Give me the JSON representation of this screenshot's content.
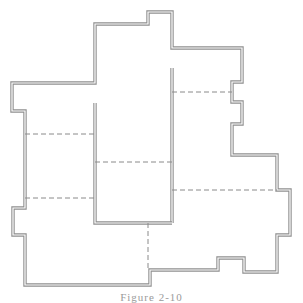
{
  "figure": {
    "caption": "Figure 2-10",
    "wall_color": "#8f8f8f",
    "dash_color": "#8a8a8a",
    "outer_wall": [
      [
        95,
        24
      ],
      [
        148,
        24
      ],
      [
        148,
        12
      ],
      [
        172,
        12
      ],
      [
        172,
        48
      ],
      [
        242,
        48
      ],
      [
        242,
        82
      ],
      [
        232,
        82
      ],
      [
        232,
        102
      ],
      [
        242,
        102
      ],
      [
        242,
        124
      ],
      [
        232,
        124
      ],
      [
        232,
        155
      ],
      [
        277,
        155
      ],
      [
        277,
        190
      ],
      [
        290,
        190
      ],
      [
        290,
        235
      ],
      [
        277,
        235
      ],
      [
        277,
        272
      ],
      [
        244,
        272
      ],
      [
        244,
        258
      ],
      [
        218,
        258
      ],
      [
        218,
        270
      ],
      [
        150,
        270
      ],
      [
        150,
        285
      ],
      [
        25,
        285
      ],
      [
        25,
        235
      ],
      [
        13,
        235
      ],
      [
        13,
        208
      ],
      [
        25,
        208
      ],
      [
        25,
        111
      ],
      [
        12,
        111
      ],
      [
        12,
        83
      ],
      [
        95,
        83
      ]
    ],
    "inner_walls": [
      [
        [
          172,
          68
        ],
        [
          172,
          223
        ]
      ],
      [
        [
          95,
          103
        ],
        [
          95,
          223
        ],
        [
          172,
          223
        ]
      ]
    ],
    "dashed_lines": [
      [
        [
          172,
          92
        ],
        [
          232,
          92
        ]
      ],
      [
        [
          25,
          134
        ],
        [
          95,
          134
        ]
      ],
      [
        [
          95,
          162
        ],
        [
          172,
          162
        ]
      ],
      [
        [
          25,
          198
        ],
        [
          95,
          198
        ]
      ],
      [
        [
          172,
          190
        ],
        [
          277,
          190
        ]
      ],
      [
        [
          148,
          223
        ],
        [
          148,
          270
        ]
      ]
    ]
  }
}
